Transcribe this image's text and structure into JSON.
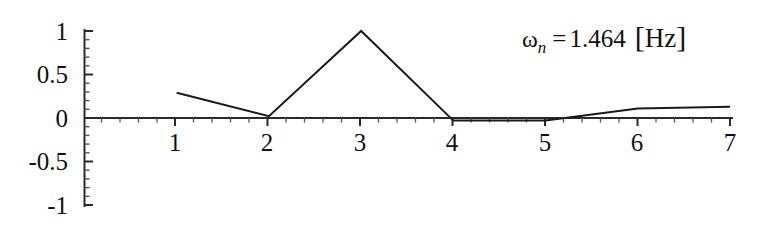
{
  "chart_data": {
    "type": "line",
    "title": "",
    "subtitle": "",
    "xlabel": "",
    "ylabel": "",
    "xlim": [
      0.1,
      7.0
    ],
    "ylim": [
      -1,
      1
    ],
    "grid": false,
    "legend": "none",
    "x_ticks": [
      1,
      2,
      3,
      4,
      5,
      6,
      7
    ],
    "x_tick_labels": [
      "1",
      "2",
      "3",
      "4",
      "5",
      "6",
      "7"
    ],
    "y_ticks": [
      -1,
      -0.5,
      0,
      0.5,
      1
    ],
    "y_tick_labels": [
      "-1",
      "-0.5",
      "0",
      "0.5",
      "1"
    ],
    "x_minor_tick_step": 0.2,
    "y_minor_tick_step": 0.1,
    "series": [
      {
        "name": "mode shape",
        "color": "#1a1a1a",
        "x": [
          1,
          2,
          3,
          4,
          5,
          6,
          7
        ],
        "values": [
          0.29,
          0.02,
          1.0,
          -0.03,
          -0.03,
          0.11,
          0.13
        ]
      }
    ],
    "annotations": [
      {
        "name": "natural-frequency",
        "symbol": "ω",
        "subscript": "n",
        "relation": "=",
        "value": "1.464",
        "unit_open": "[",
        "unit": "Hz",
        "unit_close": "]",
        "text": "ωn = 1.464 [Hz]"
      }
    ]
  },
  "axis": {
    "zero_line_label": "x-axis",
    "vertical_axis_label": "y-axis"
  }
}
